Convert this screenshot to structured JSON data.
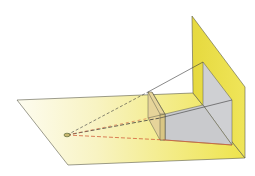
{
  "diagram": {
    "title": "",
    "colors": {
      "background": "#ffffff",
      "plane_yellow": "#ece24a",
      "plane_fade": "#fbf8d8",
      "projection_gray": "#cfd0d3",
      "object_tan": "#e6d49a",
      "edge": "#5a5a4a",
      "ray_dark": "#3a3a3a",
      "ray_red": "#d2603a"
    },
    "elements": [
      {
        "name": "ground-plane",
        "label": ""
      },
      {
        "name": "vertical-plane",
        "label": ""
      },
      {
        "name": "eye-point",
        "label": ""
      },
      {
        "name": "object-box",
        "label": ""
      },
      {
        "name": "projected-image",
        "label": ""
      },
      {
        "name": "projection-rays",
        "label": ""
      }
    ]
  }
}
